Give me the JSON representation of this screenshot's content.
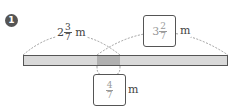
{
  "problem": {
    "number": "1"
  },
  "labels": {
    "left_length": {
      "whole": "2",
      "numerator": "3",
      "denominator": "7",
      "unit": "m"
    },
    "total_length": {
      "whole": "3",
      "numerator": "2",
      "denominator": "7",
      "unit": "m"
    },
    "overlap_length": {
      "whole": "",
      "numerator": "4",
      "denominator": "7",
      "unit": "m"
    }
  },
  "colors": {
    "bar_fill": "#d9d9d9",
    "overlap_fill": "#b0b0b0",
    "outline": "#555555"
  }
}
